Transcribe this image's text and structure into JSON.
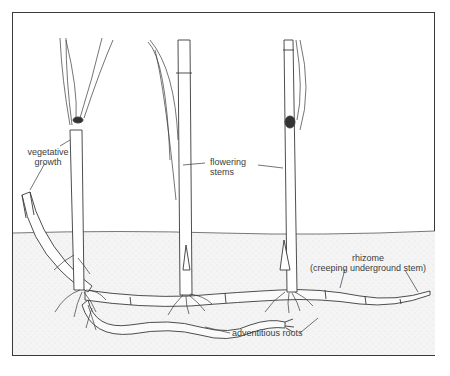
{
  "diagram": {
    "labels": {
      "vegetative_line1": "vegetative",
      "vegetative_line2": "growth",
      "flowering_line1": "flowering",
      "flowering_line2": "stems",
      "rhizome_line1": "rhizome",
      "rhizome_line2": "(creeping underground stem)",
      "adventitious": "adventitious roots"
    },
    "parts": [
      "vegetative growth",
      "flowering stems",
      "rhizome",
      "adventitious roots",
      "soil surface"
    ],
    "colors": {
      "line": "#3a3a3a",
      "soil": "#f1f1f1",
      "background": "#ffffff"
    }
  }
}
